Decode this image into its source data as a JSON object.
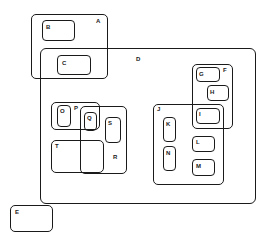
{
  "diagram": {
    "type": "nested-region-diagram",
    "regions": [
      {
        "id": "A",
        "label": "A",
        "contains": [
          "B",
          "C"
        ]
      },
      {
        "id": "B",
        "label": "B",
        "parent": "A"
      },
      {
        "id": "C",
        "label": "C",
        "parent": "A",
        "also_in": "D"
      },
      {
        "id": "D",
        "label": "D",
        "contains": [
          "C",
          "F",
          "J",
          "P",
          "R",
          "T"
        ]
      },
      {
        "id": "F",
        "label": "F",
        "contains": [
          "G",
          "H",
          "I"
        ]
      },
      {
        "id": "G",
        "label": "G",
        "parent": "F"
      },
      {
        "id": "H",
        "label": "H",
        "parent": "F"
      },
      {
        "id": "I",
        "label": "I",
        "parent": "F",
        "also_in": "J"
      },
      {
        "id": "J",
        "label": "J",
        "contains": [
          "I",
          "K",
          "L",
          "M",
          "N"
        ]
      },
      {
        "id": "K",
        "label": "K",
        "parent": "J"
      },
      {
        "id": "L",
        "label": "L",
        "parent": "J"
      },
      {
        "id": "M",
        "label": "M",
        "parent": "J"
      },
      {
        "id": "N",
        "label": "N",
        "parent": "J"
      },
      {
        "id": "P",
        "label": "P",
        "contains": [
          "O",
          "Q"
        ]
      },
      {
        "id": "O",
        "label": "O",
        "parent": "P"
      },
      {
        "id": "Q",
        "label": "Q",
        "parent": "P",
        "also_in": "R"
      },
      {
        "id": "R",
        "label": "R",
        "contains": [
          "Q",
          "S"
        ]
      },
      {
        "id": "S",
        "label": "S",
        "parent": "R"
      },
      {
        "id": "T",
        "label": "T",
        "parent": "D"
      },
      {
        "id": "E",
        "label": "E"
      }
    ]
  },
  "labels": {
    "A": "A",
    "B": "B",
    "C": "C",
    "D": "D",
    "E": "E",
    "F": "F",
    "G": "G",
    "H": "H",
    "I": "I",
    "J": "J",
    "K": "K",
    "L": "L",
    "M": "M",
    "N": "N",
    "O": "O",
    "P": "P",
    "Q": "Q",
    "R": "R",
    "S": "S",
    "T": "T"
  },
  "colors": {
    "stroke": "#1a1a1a",
    "background": "#ffffff"
  }
}
